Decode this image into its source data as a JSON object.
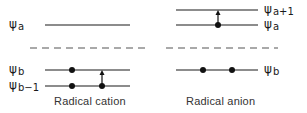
{
  "diagram": {
    "panels": [
      {
        "caption": "Radical cation",
        "levels": [
          {
            "symbol": "ψ",
            "sub": "a",
            "electrons": 0
          },
          {
            "symbol": "ψ",
            "sub": "b",
            "electrons": 1
          },
          {
            "symbol": "ψ",
            "sub": "b−1",
            "electrons": 2
          }
        ],
        "transition": {
          "from": "ψb−1",
          "to": "ψb"
        }
      },
      {
        "caption": "Radical anion",
        "levels": [
          {
            "symbol": "ψ",
            "sub": "a+1",
            "electrons": 0
          },
          {
            "symbol": "ψ",
            "sub": "a",
            "electrons": 1
          },
          {
            "symbol": "ψ",
            "sub": "b",
            "electrons": 2
          }
        ],
        "transition": {
          "from": "ψa",
          "to": "ψa+1"
        }
      }
    ],
    "divider": "dashed"
  },
  "colors": {
    "line": "#1a1a1a",
    "dash": "#555555"
  }
}
